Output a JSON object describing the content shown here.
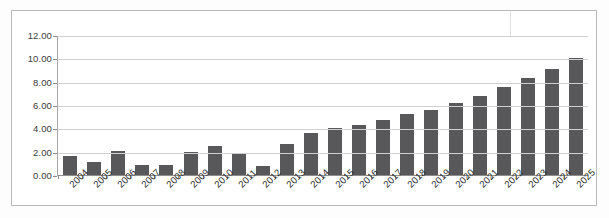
{
  "chart_data": {
    "type": "bar",
    "title": "",
    "subtitle": "",
    "xlabel": "",
    "ylabel": "",
    "grid": true,
    "legend": false,
    "legend_position": "none",
    "ylim": [
      0.0,
      12.0
    ],
    "ytick_labels": [
      "12.00",
      "10.00",
      "8.00",
      "6.00",
      "4.00",
      "2.00",
      "0.00"
    ],
    "ytick_values": [
      12.0,
      10.0,
      8.0,
      6.0,
      4.0,
      2.0,
      0.0
    ],
    "categories": [
      "2004",
      "2005",
      "2006",
      "2007",
      "2008",
      "2009",
      "2010",
      "2011",
      "2012",
      "2013",
      "2014",
      "2015",
      "2016",
      "2017",
      "2018",
      "2019",
      "2020",
      "2021",
      "2022",
      "2023",
      "2024",
      "2025"
    ],
    "values": [
      1.6,
      1.1,
      2.05,
      0.85,
      0.85,
      1.95,
      2.5,
      1.85,
      0.75,
      2.7,
      3.6,
      4.0,
      4.3,
      4.7,
      5.2,
      5.6,
      6.2,
      6.8,
      7.55,
      8.3,
      9.1,
      10.0
    ],
    "bar_color": "#58585a",
    "grid_color": "#d0d0d0",
    "axis_color": "#8e8e8e",
    "plot_background": "#ffffff"
  }
}
